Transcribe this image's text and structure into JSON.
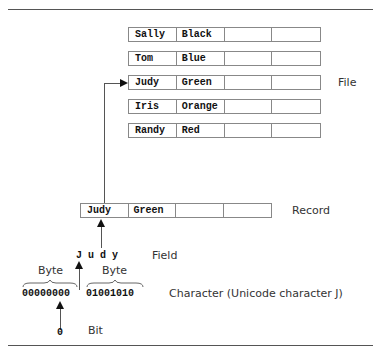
{
  "file": {
    "label": "File",
    "records": [
      {
        "first": "Sally",
        "last": "Black"
      },
      {
        "first": "Tom",
        "last": "Blue"
      },
      {
        "first": "Judy",
        "last": "Green"
      },
      {
        "first": "Iris",
        "last": "Orange"
      },
      {
        "first": "Randy",
        "last": "Red"
      }
    ]
  },
  "record": {
    "label": "Record",
    "first": "Judy",
    "last": "Green"
  },
  "field": {
    "label": "Field",
    "value": "J u d y"
  },
  "character": {
    "label": "Character (Unicode character J)",
    "byte_label": "Byte",
    "byte1": "00000000",
    "byte2": "01001010"
  },
  "bit": {
    "label": "Bit",
    "value": "0"
  }
}
